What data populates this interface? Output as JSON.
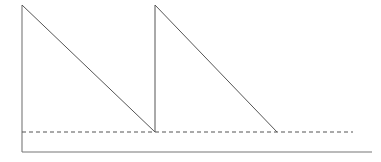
{
  "figure": {
    "title": "",
    "width": 381,
    "height": 162,
    "background_color": "#ffffff"
  },
  "chart_data": {
    "type": "line",
    "title": "",
    "subtitle": "",
    "xlabel": "",
    "ylabel": "",
    "grid": false,
    "legend": null,
    "annotations": [],
    "axis": {
      "y_axis_line": {
        "x": 22,
        "y_top": 5,
        "y_bottom": 152
      },
      "x_axis_line": {
        "y": 152,
        "x_left": 22,
        "x_right": 372
      },
      "xlim": [
        22,
        372
      ],
      "ylim": [
        152,
        5
      ],
      "x_tick_labels": [],
      "y_tick_labels": []
    },
    "series": [
      {
        "name": "sawtooth-waveform",
        "style": "solid",
        "color": "#555555",
        "width": 1,
        "points": [
          {
            "x": 22,
            "y": 5
          },
          {
            "x": 155,
            "y": 132
          },
          {
            "x": 155,
            "y": 5
          },
          {
            "x": 277,
            "y": 132
          }
        ]
      },
      {
        "name": "threshold-line",
        "style": "dashed",
        "color": "#555555",
        "width": 1,
        "dash_pattern": "4 3",
        "points": [
          {
            "x": 22,
            "y": 132
          },
          {
            "x": 353,
            "y": 132
          }
        ]
      }
    ]
  },
  "colors": {
    "stroke": "#555555",
    "axis": "#777777",
    "background": "#ffffff"
  }
}
